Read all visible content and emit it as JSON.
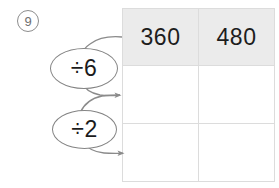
{
  "worksheet": {
    "problem_number": "9",
    "background_color": "#ffffff"
  },
  "table": {
    "header_background": "#ebebeb",
    "border_color": "#dcdcdc",
    "columns": 2,
    "rows": 3,
    "header": [
      "360",
      "480"
    ],
    "body": [
      [
        "",
        ""
      ],
      [
        "",
        ""
      ]
    ]
  },
  "operations": [
    {
      "name": "divide-by-six",
      "label": "÷6",
      "operator": "÷",
      "operand": "6"
    },
    {
      "name": "divide-by-two",
      "label": "÷2",
      "operator": "÷",
      "operand": "2"
    }
  ],
  "arrows": [
    {
      "name": "arrow-into-divide-by-six",
      "from": "header-row",
      "to": "divide-by-six",
      "has_head": false
    },
    {
      "name": "arrow-divide-by-six-to-row-two",
      "from": "divide-by-six",
      "to": "row-two",
      "has_head": true
    },
    {
      "name": "arrow-row-two-to-divide-by-two",
      "from": "row-two",
      "to": "divide-by-two",
      "has_head": true
    },
    {
      "name": "arrow-divide-by-two-to-row-three",
      "from": "divide-by-two",
      "to": "row-three",
      "has_head": true
    }
  ],
  "colors": {
    "stroke": "#8b8b8b",
    "text": "#1d1d1d",
    "marker": "#6f6f6f"
  }
}
